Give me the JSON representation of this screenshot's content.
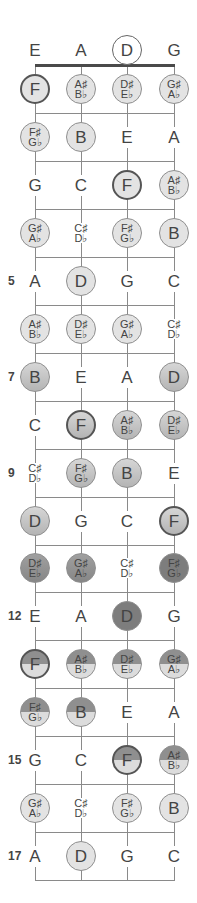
{
  "diagram": {
    "title": "",
    "strings": [
      "E",
      "A",
      "D",
      "G"
    ],
    "string_x": [
      35,
      81,
      127,
      174
    ],
    "nut_y": 65,
    "fret_spacing": 47.95,
    "fret_count": 17,
    "open_row": {
      "y": 50,
      "notes": [
        {
          "label": "E",
          "circled": false
        },
        {
          "label": "A",
          "circled": false
        },
        {
          "label": "D",
          "circled": true,
          "style": "open"
        },
        {
          "label": "G",
          "circled": false
        }
      ]
    },
    "fret_markers": [
      {
        "fret": 5,
        "label": "5"
      },
      {
        "fret": 7,
        "label": "7"
      },
      {
        "fret": 9,
        "label": "9"
      },
      {
        "fret": 12,
        "label": "12"
      },
      {
        "fret": 15,
        "label": "15"
      },
      {
        "fret": 17,
        "label": "17"
      }
    ],
    "colors": {
      "light": "#e3e3e3",
      "mid": "#c4c4c4",
      "midDark": "#a8a8a8",
      "dark": "#8c8c8c",
      "darker": "#7d7d7d",
      "halfTop": "#8f8f8f",
      "halfBottom": "#dcdcdc"
    },
    "frets": [
      {
        "fret": 1,
        "notes": [
          {
            "label": "F",
            "circled": true,
            "root": true,
            "fill": "light"
          },
          {
            "label": "A♯|B♭",
            "circled": true,
            "fill": "light"
          },
          {
            "label": "D♯|E♭",
            "circled": true,
            "fill": "light"
          },
          {
            "label": "G♯|A♭",
            "circled": true,
            "fill": "light"
          }
        ]
      },
      {
        "fret": 2,
        "notes": [
          {
            "label": "F♯|G♭",
            "circled": true,
            "fill": "light"
          },
          {
            "label": "B",
            "circled": true,
            "fill": "light"
          },
          {
            "label": "E",
            "circled": false
          },
          {
            "label": "A",
            "circled": false
          }
        ]
      },
      {
        "fret": 3,
        "notes": [
          {
            "label": "G",
            "circled": false
          },
          {
            "label": "C",
            "circled": false
          },
          {
            "label": "F",
            "circled": true,
            "root": true,
            "fill": "light"
          },
          {
            "label": "A♯|B♭",
            "circled": true,
            "fill": "light"
          }
        ]
      },
      {
        "fret": 4,
        "notes": [
          {
            "label": "G♯|A♭",
            "circled": true,
            "fill": "light"
          },
          {
            "label": "C♯|D♭",
            "circled": false
          },
          {
            "label": "F♯|G♭",
            "circled": true,
            "fill": "light"
          },
          {
            "label": "B",
            "circled": true,
            "fill": "light"
          }
        ]
      },
      {
        "fret": 5,
        "notes": [
          {
            "label": "A",
            "circled": false
          },
          {
            "label": "D",
            "circled": true,
            "fill": "light"
          },
          {
            "label": "G",
            "circled": false
          },
          {
            "label": "C",
            "circled": false
          }
        ]
      },
      {
        "fret": 6,
        "notes": [
          {
            "label": "A♯|B♭",
            "circled": true,
            "fill": "light"
          },
          {
            "label": "D♯|E♭",
            "circled": true,
            "fill": "light"
          },
          {
            "label": "G♯|A♭",
            "circled": true,
            "fill": "light"
          },
          {
            "label": "C♯|D♭",
            "circled": false
          }
        ]
      },
      {
        "fret": 7,
        "notes": [
          {
            "label": "B",
            "circled": true,
            "fill": "mid"
          },
          {
            "label": "E",
            "circled": false
          },
          {
            "label": "A",
            "circled": false
          },
          {
            "label": "D",
            "circled": true,
            "fill": "mid"
          }
        ]
      },
      {
        "fret": 8,
        "notes": [
          {
            "label": "C",
            "circled": false
          },
          {
            "label": "F",
            "circled": true,
            "root": true,
            "fill": "mid"
          },
          {
            "label": "A♯|B♭",
            "circled": true,
            "fill": "mid"
          },
          {
            "label": "D♯|E♭",
            "circled": true,
            "fill": "mid"
          }
        ]
      },
      {
        "fret": 9,
        "notes": [
          {
            "label": "C♯|D♭",
            "circled": false
          },
          {
            "label": "F♯|G♭",
            "circled": true,
            "fill": "mid"
          },
          {
            "label": "B",
            "circled": true,
            "fill": "mid"
          },
          {
            "label": "E",
            "circled": false
          }
        ]
      },
      {
        "fret": 10,
        "notes": [
          {
            "label": "D",
            "circled": true,
            "fill": "mid"
          },
          {
            "label": "G",
            "circled": false
          },
          {
            "label": "C",
            "circled": false
          },
          {
            "label": "F",
            "circled": true,
            "root": true,
            "fill": "mid"
          }
        ]
      },
      {
        "fret": 11,
        "notes": [
          {
            "label": "D♯|E♭",
            "circled": true,
            "fill": "dark"
          },
          {
            "label": "G♯|A♭",
            "circled": true,
            "fill": "dark"
          },
          {
            "label": "C♯|D♭",
            "circled": false
          },
          {
            "label": "F♯|G♭",
            "circled": true,
            "fill": "darker"
          }
        ]
      },
      {
        "fret": 12,
        "notes": [
          {
            "label": "E",
            "circled": false
          },
          {
            "label": "A",
            "circled": false
          },
          {
            "label": "D",
            "circled": true,
            "fill": "darker"
          },
          {
            "label": "G",
            "circled": false
          }
        ]
      },
      {
        "fret": 13,
        "notes": [
          {
            "label": "F",
            "circled": true,
            "root": true,
            "fill": "half"
          },
          {
            "label": "A♯|B♭",
            "circled": true,
            "fill": "half"
          },
          {
            "label": "D♯|E♭",
            "circled": true,
            "fill": "half"
          },
          {
            "label": "G♯|A♭",
            "circled": true,
            "fill": "half"
          }
        ]
      },
      {
        "fret": 14,
        "notes": [
          {
            "label": "F♯|G♭",
            "circled": true,
            "fill": "half"
          },
          {
            "label": "B",
            "circled": true,
            "fill": "half"
          },
          {
            "label": "E",
            "circled": false
          },
          {
            "label": "A",
            "circled": false
          }
        ]
      },
      {
        "fret": 15,
        "notes": [
          {
            "label": "G",
            "circled": false
          },
          {
            "label": "C",
            "circled": false
          },
          {
            "label": "F",
            "circled": true,
            "root": true,
            "fill": "half"
          },
          {
            "label": "A♯|B♭",
            "circled": true,
            "fill": "half"
          }
        ]
      },
      {
        "fret": 16,
        "notes": [
          {
            "label": "G♯|A♭",
            "circled": true,
            "fill": "light"
          },
          {
            "label": "C♯|D♭",
            "circled": false
          },
          {
            "label": "F♯|G♭",
            "circled": true,
            "fill": "light"
          },
          {
            "label": "B",
            "circled": true,
            "fill": "light"
          }
        ]
      },
      {
        "fret": 17,
        "notes": [
          {
            "label": "A",
            "circled": false
          },
          {
            "label": "D",
            "circled": true,
            "fill": "light"
          },
          {
            "label": "G",
            "circled": false
          },
          {
            "label": "C",
            "circled": false
          }
        ]
      }
    ]
  }
}
